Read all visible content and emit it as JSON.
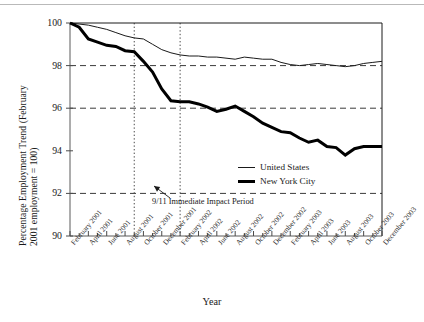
{
  "chart_data": {
    "type": "line",
    "title": "",
    "xlabel": "Year",
    "ylabel_line1": "Percentage Employment Trend (February",
    "ylabel_line2": "2001 employment = 100)",
    "ylim": [
      90,
      100
    ],
    "yticks": [
      100,
      98,
      96,
      94,
      92,
      90
    ],
    "grid": "horizontal dashed gridlines at 98, 96, 92; vertical dotted lines at September 2001 and February 2002",
    "legend_position": "inside right, middle-lower",
    "x": [
      "February 2001",
      "March 2001",
      "April 2001",
      "May 2001",
      "June 2001",
      "July 2001",
      "August 2001",
      "September 2001",
      "October 2001",
      "November 2001",
      "December 2001",
      "January 2002",
      "February 2002",
      "March 2002",
      "April 2002",
      "May 2002",
      "June 2002",
      "July 2002",
      "August 2002",
      "September 2002",
      "October 2002",
      "November 2002",
      "December 2002",
      "January 2003",
      "February 2003",
      "March 2003",
      "April 2003",
      "May 2003",
      "June 2003",
      "July 2003",
      "August 2003",
      "September 2003",
      "October 2003",
      "November 2003",
      "December 2003"
    ],
    "xticks": [
      "February 2001",
      "April 2001",
      "June 2001",
      "August 2001",
      "October 2001",
      "December 2001",
      "February 2002",
      "April 2002",
      "June 2002",
      "August 2002",
      "October 2002",
      "December 2002",
      "February 2003",
      "April 2003",
      "June 2003",
      "August 2003",
      "October 2003",
      "December 2003"
    ],
    "series": [
      {
        "name": "United States",
        "color": "#1a1a1a",
        "line_width": 1,
        "values": [
          100.0,
          99.95,
          99.9,
          99.8,
          99.7,
          99.55,
          99.4,
          99.3,
          99.25,
          99.0,
          98.75,
          98.6,
          98.5,
          98.45,
          98.45,
          98.4,
          98.4,
          98.35,
          98.3,
          98.4,
          98.35,
          98.3,
          98.3,
          98.15,
          98.05,
          98.0,
          98.05,
          98.1,
          98.05,
          98.0,
          97.95,
          98.0,
          98.1,
          98.15,
          98.2
        ]
      },
      {
        "name": "New York City",
        "color": "#000000",
        "line_width": 3,
        "values": [
          100.0,
          99.8,
          99.25,
          99.1,
          98.95,
          98.9,
          98.7,
          98.65,
          98.2,
          97.7,
          96.9,
          96.35,
          96.3,
          96.3,
          96.2,
          96.05,
          95.85,
          95.95,
          96.1,
          95.85,
          95.6,
          95.3,
          95.1,
          94.9,
          94.85,
          94.6,
          94.4,
          94.5,
          94.2,
          94.15,
          93.8,
          94.1,
          94.2,
          94.2,
          94.2
        ]
      }
    ],
    "annotations": [
      {
        "text": "9/11 Immediate Impact Period",
        "points_to": "span between September 2001 and February 2002 vertical dotted lines"
      }
    ]
  }
}
